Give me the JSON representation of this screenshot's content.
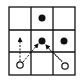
{
  "diagram": {
    "grid": {
      "rows": 3,
      "cols": 3,
      "x": 9,
      "y": 7,
      "cell": 22,
      "line_color": "#111111"
    },
    "filled_dots": [
      {
        "row": 0,
        "col": 1
      },
      {
        "row": 1,
        "col": 1
      },
      {
        "row": 1,
        "col": 2
      }
    ],
    "open_circles": [
      {
        "row": 2,
        "col": 0
      },
      {
        "row": 2,
        "col": 2
      }
    ],
    "arrows": [
      {
        "from": "circle-2-0",
        "to": "up",
        "style": "dashed"
      },
      {
        "from": "circle-2-0",
        "to": "dot-1-1",
        "style": "dashed"
      },
      {
        "from": "circle-2-2",
        "to": "dot-1-1",
        "style": "wavy"
      }
    ]
  }
}
